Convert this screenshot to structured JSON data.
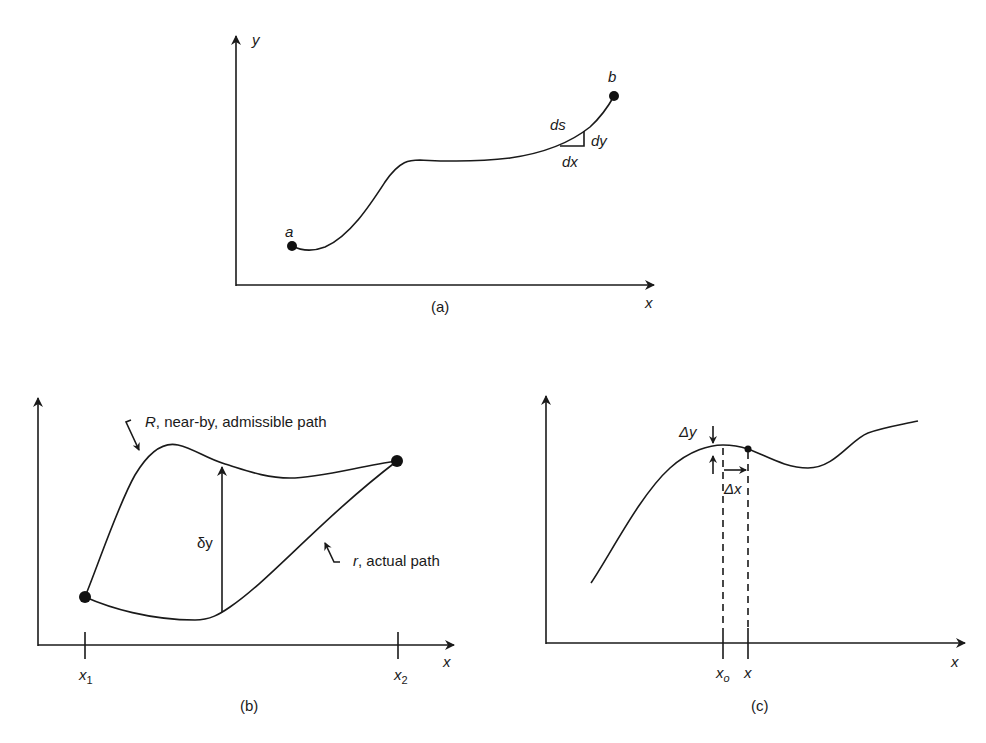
{
  "figure": {
    "panel_a": {
      "caption": "(a)",
      "x_axis_label": "x",
      "y_axis_label": "y",
      "point_start_label": "a",
      "point_end_label": "b",
      "arc_label": "ds",
      "dx_label": "dx",
      "dy_label": "dy"
    },
    "panel_b": {
      "caption": "(b)",
      "x_axis_label": "x",
      "tick_1_label": "x",
      "tick_1_sub": "1",
      "tick_2_label": "x",
      "tick_2_sub": "2",
      "variation_label": "δy",
      "upper_path_letter": "R",
      "upper_path_text": ", near-by, admissible path",
      "lower_path_letter": "r",
      "lower_path_text": ", actual path"
    },
    "panel_c": {
      "caption": "(c)",
      "x_axis_label": "x",
      "tick_1_label": "x",
      "tick_1_sub": "o",
      "tick_2_label": "x",
      "delta_y_label": "Δy",
      "delta_x_label": "Δx"
    },
    "colors": {
      "ink": "#1a1a1a",
      "background": "#ffffff"
    }
  }
}
